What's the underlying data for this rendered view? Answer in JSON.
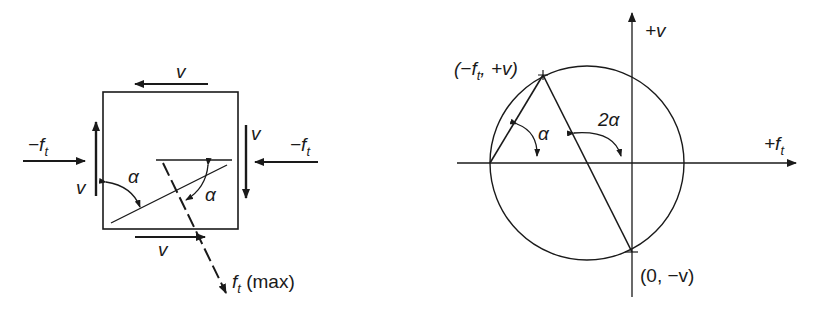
{
  "left_diagram": {
    "shear_top": "v",
    "shear_bottom": "v",
    "shear_left": "v",
    "shear_right": "v",
    "compression_left": {
      "prefix": "−f",
      "sub": "t"
    },
    "compression_right": {
      "prefix": "−f",
      "sub": "t"
    },
    "angle_left": "α",
    "angle_right": "α",
    "principal_label": {
      "main": "f",
      "sub": "t",
      "suffix": " (max)"
    }
  },
  "right_diagram": {
    "axis_v": "+v",
    "axis_f": {
      "main": "+f",
      "sub": "t"
    },
    "point_top": {
      "open": "(−f",
      "sub": "t",
      "close": ", +v)"
    },
    "point_bottom": "(0, −v)",
    "angle_alpha": "α",
    "angle_2alpha": "2α"
  },
  "colors": {
    "ink": "#1a1a1a",
    "background": "#ffffff"
  }
}
